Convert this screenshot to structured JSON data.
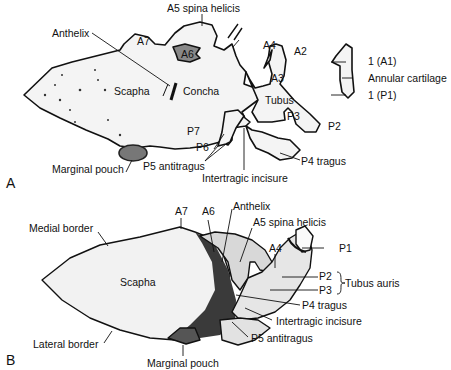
{
  "figure": {
    "panel_a": {
      "letter": "A",
      "labels": {
        "a5": "A5 spina helicis",
        "anthelix": "Anthelix",
        "a7": "A7",
        "a6": "A6",
        "a4": "A4",
        "a2": "A2",
        "a3": "A3",
        "scapha": "Scapha",
        "concha": "Concha",
        "tubus": "Tubus",
        "p3": "P3",
        "p2": "P2",
        "p7": "P7",
        "p6": "P6",
        "p5": "P5 antitragus",
        "p4": "P4 tragus",
        "intertragic": "Intertragic incisure",
        "marginal": "Marginal pouch",
        "a1": "1 (A1)",
        "annular": "Annular cartilage",
        "p1": "1 (P1)"
      }
    },
    "panel_b": {
      "letter": "B",
      "labels": {
        "a7": "A7",
        "a6": "A6",
        "anthelix": "Anthelix",
        "a5": "A5 spina helicis",
        "a4": "A4",
        "p1": "P1",
        "medial": "Medial border",
        "scapha": "Scapha",
        "p2": "P2",
        "p3": "P3",
        "tubus_auris": "Tubus auris",
        "p4": "P4 tragus",
        "intertragic": "Intertragic incisure",
        "p5": "P5 antitragus",
        "lateral": "Lateral border",
        "marginal": "Marginal pouch"
      }
    }
  }
}
